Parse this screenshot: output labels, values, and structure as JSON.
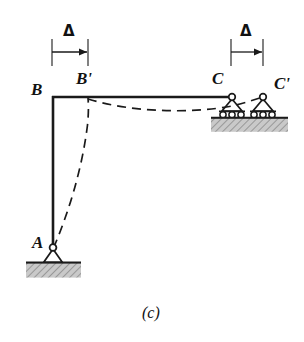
{
  "figure": {
    "caption": "(c)",
    "type": "structural-frame-deflection-diagram",
    "labels": {
      "joint_a": "A",
      "joint_b": "B",
      "joint_b_displaced": "B'",
      "joint_c": "C",
      "joint_c_displaced": "C'",
      "delta_left": "Δ",
      "delta_right": "Δ"
    },
    "dimensions": [
      {
        "name": "delta-left",
        "label": "Δ",
        "from_x": 52,
        "to_x": 88,
        "line_y": 52
      },
      {
        "name": "delta-right",
        "label": "Δ",
        "from_x": 231,
        "to_x": 263,
        "line_y": 52
      }
    ],
    "geometry": {
      "joint_a": {
        "x": 53,
        "y": 248
      },
      "joint_b": {
        "x": 53,
        "y": 97
      },
      "joint_b_displaced": {
        "x": 88,
        "y": 98
      },
      "joint_c": {
        "x": 232,
        "y": 97
      },
      "joint_c_displaced": {
        "x": 263,
        "y": 97
      },
      "ground_a_y": 262,
      "ground_c_y": 118
    },
    "colors": {
      "line": "#1a1a1a",
      "ground_fill": "#b0b0b0",
      "background": "#ffffff"
    },
    "supports": [
      {
        "name": "pin-support-a",
        "kind": "pin",
        "at": "A"
      },
      {
        "name": "roller-support-c",
        "kind": "roller",
        "at": "C"
      },
      {
        "name": "roller-support-c-displaced",
        "kind": "roller",
        "at": "C'"
      }
    ]
  }
}
